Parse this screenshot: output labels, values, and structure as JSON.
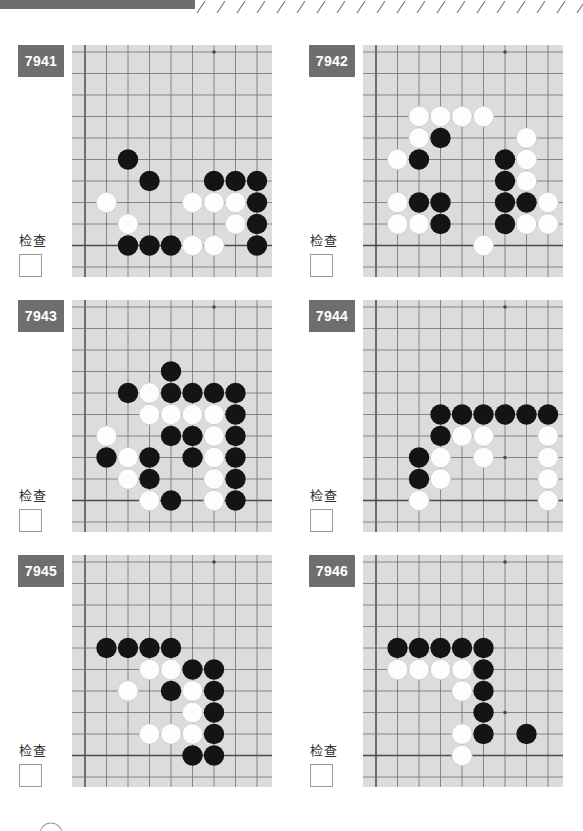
{
  "page": {
    "topbar_color": "#6e6e6e",
    "board_color": "#dcdcdc",
    "line_color": "#555555",
    "black_stone_color": "#141414",
    "white_stone_color": "#fdfdfd",
    "badge_bg": "#6e6e6e",
    "badge_fg": "#ffffff"
  },
  "board_spec": {
    "cols": 9,
    "rows": 10,
    "cell": 21.5,
    "origin_x": 13,
    "origin_y": 7,
    "stone_radius": 10.2,
    "edge_left_col": 0,
    "edge_bottom_row": 9,
    "star_points": [
      [
        6,
        0
      ],
      [
        6,
        7
      ]
    ]
  },
  "puzzles": [
    {
      "id": "7941",
      "number": "7941",
      "check_label": "检查",
      "checked": false,
      "star_points": [
        [
          6,
          0
        ],
        [
          6,
          7
        ]
      ],
      "stones": [
        {
          "c": 2,
          "r": 5,
          "color": "black"
        },
        {
          "c": 3,
          "r": 6,
          "color": "black"
        },
        {
          "c": 6,
          "r": 6,
          "color": "black"
        },
        {
          "c": 7,
          "r": 6,
          "color": "black"
        },
        {
          "c": 8,
          "r": 6,
          "color": "black"
        },
        {
          "c": 1,
          "r": 7,
          "color": "white"
        },
        {
          "c": 5,
          "r": 7,
          "color": "white"
        },
        {
          "c": 6,
          "r": 7,
          "color": "white"
        },
        {
          "c": 7,
          "r": 7,
          "color": "white"
        },
        {
          "c": 8,
          "r": 7,
          "color": "black"
        },
        {
          "c": 2,
          "r": 8,
          "color": "white"
        },
        {
          "c": 7,
          "r": 8,
          "color": "white"
        },
        {
          "c": 8,
          "r": 8,
          "color": "black"
        },
        {
          "c": 2,
          "r": 9,
          "color": "black"
        },
        {
          "c": 3,
          "r": 9,
          "color": "black"
        },
        {
          "c": 4,
          "r": 9,
          "color": "black"
        },
        {
          "c": 5,
          "r": 9,
          "color": "white"
        },
        {
          "c": 6,
          "r": 9,
          "color": "white"
        },
        {
          "c": 8,
          "r": 9,
          "color": "black"
        }
      ]
    },
    {
      "id": "7942",
      "number": "7942",
      "check_label": "检查",
      "checked": false,
      "star_points": [
        [
          6,
          0
        ],
        [
          6,
          7
        ]
      ],
      "stones": [
        {
          "c": 2,
          "r": 3,
          "color": "white"
        },
        {
          "c": 3,
          "r": 3,
          "color": "white"
        },
        {
          "c": 4,
          "r": 3,
          "color": "white"
        },
        {
          "c": 5,
          "r": 3,
          "color": "white"
        },
        {
          "c": 2,
          "r": 4,
          "color": "white"
        },
        {
          "c": 3,
          "r": 4,
          "color": "black"
        },
        {
          "c": 7,
          "r": 4,
          "color": "white"
        },
        {
          "c": 1,
          "r": 5,
          "color": "white"
        },
        {
          "c": 2,
          "r": 5,
          "color": "black"
        },
        {
          "c": 6,
          "r": 5,
          "color": "black"
        },
        {
          "c": 7,
          "r": 5,
          "color": "white"
        },
        {
          "c": 6,
          "r": 6,
          "color": "black"
        },
        {
          "c": 7,
          "r": 6,
          "color": "white"
        },
        {
          "c": 1,
          "r": 7,
          "color": "white"
        },
        {
          "c": 2,
          "r": 7,
          "color": "black"
        },
        {
          "c": 3,
          "r": 7,
          "color": "black"
        },
        {
          "c": 6,
          "r": 7,
          "color": "black"
        },
        {
          "c": 7,
          "r": 7,
          "color": "black"
        },
        {
          "c": 8,
          "r": 7,
          "color": "white"
        },
        {
          "c": 1,
          "r": 8,
          "color": "white"
        },
        {
          "c": 2,
          "r": 8,
          "color": "white"
        },
        {
          "c": 3,
          "r": 8,
          "color": "black"
        },
        {
          "c": 6,
          "r": 8,
          "color": "black"
        },
        {
          "c": 7,
          "r": 8,
          "color": "white"
        },
        {
          "c": 8,
          "r": 8,
          "color": "white"
        },
        {
          "c": 5,
          "r": 9,
          "color": "white"
        }
      ]
    },
    {
      "id": "7943",
      "number": "7943",
      "check_label": "检查",
      "checked": false,
      "star_points": [
        [
          6,
          0
        ],
        [
          6,
          7
        ]
      ],
      "stones": [
        {
          "c": 4,
          "r": 3,
          "color": "black"
        },
        {
          "c": 2,
          "r": 4,
          "color": "black"
        },
        {
          "c": 3,
          "r": 4,
          "color": "white"
        },
        {
          "c": 4,
          "r": 4,
          "color": "black"
        },
        {
          "c": 5,
          "r": 4,
          "color": "black"
        },
        {
          "c": 6,
          "r": 4,
          "color": "black"
        },
        {
          "c": 7,
          "r": 4,
          "color": "black"
        },
        {
          "c": 3,
          "r": 5,
          "color": "white"
        },
        {
          "c": 4,
          "r": 5,
          "color": "white"
        },
        {
          "c": 5,
          "r": 5,
          "color": "white"
        },
        {
          "c": 6,
          "r": 5,
          "color": "white"
        },
        {
          "c": 7,
          "r": 5,
          "color": "black"
        },
        {
          "c": 1,
          "r": 6,
          "color": "white"
        },
        {
          "c": 4,
          "r": 6,
          "color": "black"
        },
        {
          "c": 5,
          "r": 6,
          "color": "black"
        },
        {
          "c": 6,
          "r": 6,
          "color": "white"
        },
        {
          "c": 7,
          "r": 6,
          "color": "black"
        },
        {
          "c": 1,
          "r": 7,
          "color": "black"
        },
        {
          "c": 2,
          "r": 7,
          "color": "white"
        },
        {
          "c": 3,
          "r": 7,
          "color": "black"
        },
        {
          "c": 5,
          "r": 7,
          "color": "black"
        },
        {
          "c": 6,
          "r": 7,
          "color": "white"
        },
        {
          "c": 7,
          "r": 7,
          "color": "black"
        },
        {
          "c": 2,
          "r": 8,
          "color": "white"
        },
        {
          "c": 3,
          "r": 8,
          "color": "black"
        },
        {
          "c": 6,
          "r": 8,
          "color": "white"
        },
        {
          "c": 7,
          "r": 8,
          "color": "black"
        },
        {
          "c": 3,
          "r": 9,
          "color": "white"
        },
        {
          "c": 4,
          "r": 9,
          "color": "black"
        },
        {
          "c": 6,
          "r": 9,
          "color": "white"
        },
        {
          "c": 7,
          "r": 9,
          "color": "black"
        }
      ]
    },
    {
      "id": "7944",
      "number": "7944",
      "check_label": "检查",
      "checked": false,
      "star_points": [
        [
          6,
          0
        ],
        [
          6,
          7
        ]
      ],
      "stones": [
        {
          "c": 3,
          "r": 5,
          "color": "black"
        },
        {
          "c": 4,
          "r": 5,
          "color": "black"
        },
        {
          "c": 5,
          "r": 5,
          "color": "black"
        },
        {
          "c": 6,
          "r": 5,
          "color": "black"
        },
        {
          "c": 7,
          "r": 5,
          "color": "black"
        },
        {
          "c": 8,
          "r": 5,
          "color": "black"
        },
        {
          "c": 3,
          "r": 6,
          "color": "black"
        },
        {
          "c": 4,
          "r": 6,
          "color": "white"
        },
        {
          "c": 5,
          "r": 6,
          "color": "white"
        },
        {
          "c": 8,
          "r": 6,
          "color": "white"
        },
        {
          "c": 2,
          "r": 7,
          "color": "black"
        },
        {
          "c": 3,
          "r": 7,
          "color": "white"
        },
        {
          "c": 5,
          "r": 7,
          "color": "white"
        },
        {
          "c": 8,
          "r": 7,
          "color": "white"
        },
        {
          "c": 2,
          "r": 8,
          "color": "black"
        },
        {
          "c": 3,
          "r": 8,
          "color": "white"
        },
        {
          "c": 8,
          "r": 8,
          "color": "white"
        },
        {
          "c": 2,
          "r": 9,
          "color": "white"
        },
        {
          "c": 8,
          "r": 9,
          "color": "white"
        }
      ]
    },
    {
      "id": "7945",
      "number": "7945",
      "check_label": "检查",
      "checked": false,
      "star_points": [
        [
          6,
          0
        ],
        [
          6,
          7
        ]
      ],
      "stones": [
        {
          "c": 1,
          "r": 4,
          "color": "black"
        },
        {
          "c": 2,
          "r": 4,
          "color": "black"
        },
        {
          "c": 3,
          "r": 4,
          "color": "black"
        },
        {
          "c": 4,
          "r": 4,
          "color": "black"
        },
        {
          "c": 3,
          "r": 5,
          "color": "white"
        },
        {
          "c": 4,
          "r": 5,
          "color": "white"
        },
        {
          "c": 5,
          "r": 5,
          "color": "black"
        },
        {
          "c": 6,
          "r": 5,
          "color": "black"
        },
        {
          "c": 2,
          "r": 6,
          "color": "white"
        },
        {
          "c": 4,
          "r": 6,
          "color": "black"
        },
        {
          "c": 5,
          "r": 6,
          "color": "white"
        },
        {
          "c": 6,
          "r": 6,
          "color": "black"
        },
        {
          "c": 5,
          "r": 7,
          "color": "white"
        },
        {
          "c": 6,
          "r": 7,
          "color": "black"
        },
        {
          "c": 3,
          "r": 8,
          "color": "white"
        },
        {
          "c": 4,
          "r": 8,
          "color": "white"
        },
        {
          "c": 5,
          "r": 8,
          "color": "white"
        },
        {
          "c": 6,
          "r": 8,
          "color": "black"
        },
        {
          "c": 5,
          "r": 9,
          "color": "black"
        },
        {
          "c": 6,
          "r": 9,
          "color": "black"
        }
      ]
    },
    {
      "id": "7946",
      "number": "7946",
      "check_label": "检查",
      "checked": false,
      "star_points": [
        [
          6,
          0
        ],
        [
          6,
          7
        ]
      ],
      "stones": [
        {
          "c": 1,
          "r": 4,
          "color": "black"
        },
        {
          "c": 2,
          "r": 4,
          "color": "black"
        },
        {
          "c": 3,
          "r": 4,
          "color": "black"
        },
        {
          "c": 4,
          "r": 4,
          "color": "black"
        },
        {
          "c": 5,
          "r": 4,
          "color": "black"
        },
        {
          "c": 1,
          "r": 5,
          "color": "white"
        },
        {
          "c": 2,
          "r": 5,
          "color": "white"
        },
        {
          "c": 3,
          "r": 5,
          "color": "white"
        },
        {
          "c": 4,
          "r": 5,
          "color": "white"
        },
        {
          "c": 5,
          "r": 5,
          "color": "black"
        },
        {
          "c": 4,
          "r": 6,
          "color": "white"
        },
        {
          "c": 5,
          "r": 6,
          "color": "black"
        },
        {
          "c": 5,
          "r": 7,
          "color": "black"
        },
        {
          "c": 4,
          "r": 8,
          "color": "white"
        },
        {
          "c": 5,
          "r": 8,
          "color": "black"
        },
        {
          "c": 7,
          "r": 8,
          "color": "black"
        },
        {
          "c": 4,
          "r": 9,
          "color": "white"
        }
      ]
    }
  ]
}
